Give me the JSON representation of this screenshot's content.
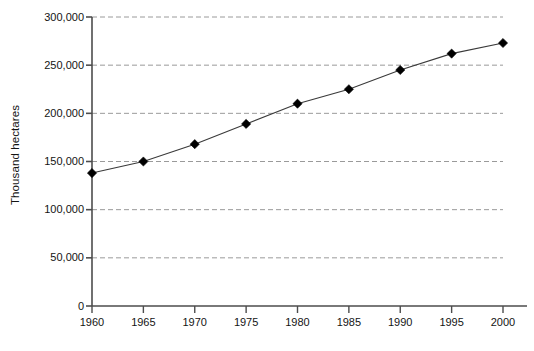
{
  "chart_data": {
    "type": "line",
    "title": "",
    "subtitle": "",
    "xlabel": "",
    "ylabel": "Thousand hectares",
    "x": [
      1960,
      1965,
      1970,
      1975,
      1980,
      1985,
      1990,
      1995,
      2000
    ],
    "categories": [
      "1960",
      "1965",
      "1970",
      "1975",
      "1980",
      "1985",
      "1990",
      "1995",
      "2000"
    ],
    "values": [
      138000,
      150000,
      168000,
      189000,
      210000,
      225000,
      245000,
      262000,
      273000
    ],
    "series": [
      {
        "name": "Thousand hectares",
        "values": [
          138000,
          150000,
          168000,
          189000,
          210000,
          225000,
          245000,
          262000,
          273000
        ]
      }
    ],
    "xlim": [
      1960,
      2000
    ],
    "ylim": [
      0,
      300000
    ],
    "ytick_values": [
      0,
      50000,
      100000,
      150000,
      200000,
      250000,
      300000
    ],
    "ytick_labels": [
      "0",
      "50,000",
      "100,000",
      "150,000",
      "200,000",
      "250,000",
      "300,000"
    ],
    "xtick_values": [
      1960,
      1965,
      1970,
      1975,
      1980,
      1985,
      1990,
      1995,
      2000
    ],
    "xtick_labels": [
      "1960",
      "1965",
      "1970",
      "1975",
      "1980",
      "1985",
      "1990",
      "1995",
      "2000"
    ],
    "grid": "horizontal-dashed",
    "legend": "none",
    "marker": "diamond",
    "marker_color": "#000000",
    "line_color": "#3a3a3a",
    "grid_color": "#9a9a9a",
    "axis_color": "#4d4d4d",
    "background": "#ffffff"
  },
  "caption": {
    "bottom_fragment": ""
  }
}
